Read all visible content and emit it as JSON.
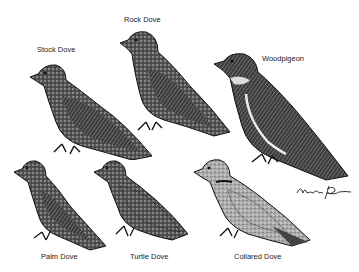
{
  "illustration": {
    "title": "Doves and Pigeons",
    "birds": [
      {
        "name": "Rock Dove",
        "label": "Rock Dove"
      },
      {
        "name": "Stock Dove",
        "label": "Stock Dove"
      },
      {
        "name": "Woodpigeon",
        "label": "Woodpigeon"
      },
      {
        "name": "Palm Dove",
        "label": "Palm Dove"
      },
      {
        "name": "Turtle Dove",
        "label": "Turtle Dove"
      },
      {
        "name": "Collared Dove",
        "label": "Collared Dove"
      }
    ],
    "colors": {
      "ink": "#1a1a1a",
      "mid": "#6a6a6a",
      "light": "#bdbdbd",
      "paper": "#ffffff"
    }
  }
}
